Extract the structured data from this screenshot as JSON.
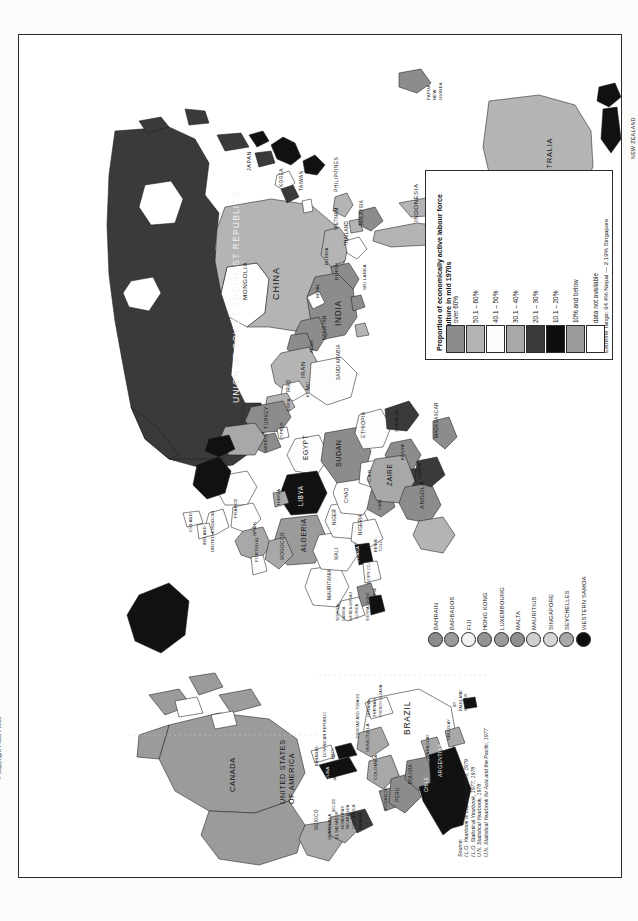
{
  "document": {
    "title": "Workers on the land",
    "copyright": "© Copyright Pluto Press"
  },
  "legend": {
    "title_line1": "Proportion of economically active labour force",
    "title_line2": "in agriculture in mid 1970s",
    "extreme_range": "Extreme range: 94.4% Nepal — 2.19% Singapore",
    "items": [
      {
        "label": "over 60%",
        "color": "#8c8c8c"
      },
      {
        "label": "50.1  –  60%",
        "color": "#b4b4b4"
      },
      {
        "label": "40.1  –  50%",
        "color": "#fbfbfb"
      },
      {
        "label": "30.1  –  40%",
        "color": "#a8a8a8"
      },
      {
        "label": "20.1  –  30%",
        "color": "#3a3a3a"
      },
      {
        "label": "10.1  –  20%",
        "color": "#0d0d0d"
      },
      {
        "label": "10% and below",
        "color": "#9b9b9b"
      },
      {
        "label": "data not available",
        "color": "#ffffff"
      }
    ]
  },
  "micro_states": {
    "items": [
      {
        "label": "BAHRAIN",
        "color": "#8c8c8c"
      },
      {
        "label": "BARBADOS",
        "color": "#9b9b9b"
      },
      {
        "label": "FIJI",
        "color": "#f2f2f2"
      },
      {
        "label": "HONG KONG",
        "color": "#949494"
      },
      {
        "label": "LUXEMBOURG",
        "color": "#9b9b9b"
      },
      {
        "label": "MALTA",
        "color": "#8f8f8f"
      },
      {
        "label": "MAURITIUS",
        "color": "#cfcfcf"
      },
      {
        "label": "SINGAPORE",
        "color": "#d5d5d5"
      },
      {
        "label": "SEYCHELLES",
        "color": "#a8a8a8"
      },
      {
        "label": "WESTERN SAMOA",
        "color": "#0d0d0d"
      }
    ]
  },
  "source": {
    "heading": "Source:",
    "lines": [
      "I.L.O. Yearbook of Labour Statistics, 1979",
      "I.L.O. Statistical Yearbook, 1977, 1978",
      "U.N. Statistical Yearbook, 1978",
      "U.N. Statistical Yearbook for Asia and the Pacific, 1977"
    ]
  },
  "map_labels": [
    {
      "text": "UNION OF SOVIET SOCIALIST REPUBLICS",
      "x": 222,
      "y": 358,
      "size": 8.6,
      "ls": 1.1,
      "color": "#f2f2f2"
    },
    {
      "text": "CHINA",
      "x": 262,
      "y": 255,
      "size": 9.0,
      "ls": 1.0,
      "color": "#141414"
    },
    {
      "text": "MONGOLIA",
      "x": 229,
      "y": 258,
      "size": 6.2,
      "ls": 0.6,
      "color": "#141414"
    },
    {
      "text": "INDIA",
      "x": 324,
      "y": 282,
      "size": 8.2,
      "ls": 0.8,
      "color": "#141414"
    },
    {
      "text": "JAPAN",
      "x": 233,
      "y": 130,
      "size": 5.6,
      "ls": 0.5,
      "color": "#141414"
    },
    {
      "text": "KOREA",
      "x": 265,
      "y": 147,
      "size": 4.8,
      "ls": 0.4,
      "color": "#141414"
    },
    {
      "text": "TAIWAN",
      "x": 285,
      "y": 151,
      "size": 4.8,
      "ls": 0.4,
      "color": "#141414"
    },
    {
      "text": "PHILIPPINES",
      "x": 320,
      "y": 151,
      "size": 5.0,
      "ls": 0.4,
      "color": "#141414"
    },
    {
      "text": "VIETNAM",
      "x": 320,
      "y": 190,
      "size": 4.6,
      "ls": 0.3,
      "color": "#141414"
    },
    {
      "text": "THAILAND",
      "x": 330,
      "y": 206,
      "size": 4.6,
      "ls": 0.3,
      "color": "#141414"
    },
    {
      "text": "MALAYSIA",
      "x": 345,
      "y": 185,
      "size": 4.6,
      "ls": 0.3,
      "color": "#141414"
    },
    {
      "text": "INDONESIA",
      "x": 400,
      "y": 180,
      "size": 6.2,
      "ls": 0.5,
      "color": "#141414"
    },
    {
      "text": "PAPUA",
      "x": 412,
      "y": 60,
      "size": 4.2,
      "ls": 0.3,
      "color": "#141414"
    },
    {
      "text": "NEW",
      "x": 418,
      "y": 60,
      "size": 4.2,
      "ls": 0.3,
      "color": "#141414"
    },
    {
      "text": "GUINEA",
      "x": 424,
      "y": 60,
      "size": 4.2,
      "ls": 0.3,
      "color": "#141414"
    },
    {
      "text": "AUSTRALIA",
      "x": 535,
      "y": 142,
      "size": 7.4,
      "ls": 0.8,
      "color": "#141414"
    },
    {
      "text": "NEW ZEALAND",
      "x": 617,
      "y": 118,
      "size": 5.2,
      "ls": 0.4,
      "color": "#141414"
    },
    {
      "text": "BURMA",
      "x": 310,
      "y": 225,
      "size": 4.4,
      "ls": 0.3,
      "color": "#141414"
    },
    {
      "text": "B'DESH",
      "x": 320,
      "y": 240,
      "size": 4.4,
      "ls": 0.3,
      "color": "#141414"
    },
    {
      "text": "SRI LANKA",
      "x": 348,
      "y": 250,
      "size": 4.4,
      "ls": 0.3,
      "color": "#141414"
    },
    {
      "text": "NEPAL",
      "x": 301,
      "y": 258,
      "size": 4.0,
      "ls": 0.3,
      "color": "#141414"
    },
    {
      "text": "PAKISTAN",
      "x": 308,
      "y": 300,
      "size": 4.6,
      "ls": 0.3,
      "color": "#141414"
    },
    {
      "text": "AFGH",
      "x": 295,
      "y": 313,
      "size": 4.2,
      "ls": 0.3,
      "color": "#141414"
    },
    {
      "text": "IRAN",
      "x": 287,
      "y": 336,
      "size": 6.2,
      "ls": 0.5,
      "color": "#141414"
    },
    {
      "text": "IRAQ",
      "x": 272,
      "y": 352,
      "size": 4.6,
      "ls": 0.3,
      "color": "#141414"
    },
    {
      "text": "SAUDI ARABIA",
      "x": 322,
      "y": 340,
      "size": 4.6,
      "ls": 0.3,
      "color": "#141414"
    },
    {
      "text": "KUWAIT",
      "x": 291,
      "y": 358,
      "size": 3.8,
      "ls": 0.2,
      "color": "#141414"
    },
    {
      "text": "TURKEY",
      "x": 250,
      "y": 388,
      "size": 5.0,
      "ls": 0.4,
      "color": "#141414"
    },
    {
      "text": "SYRIA",
      "x": 272,
      "y": 372,
      "size": 3.8,
      "ls": 0.2,
      "color": "#141414"
    },
    {
      "text": "CYPRUS",
      "x": 265,
      "y": 400,
      "size": 4.0,
      "ls": 0.2,
      "color": "#141414"
    },
    {
      "text": "GREECE",
      "x": 249,
      "y": 412,
      "size": 4.2,
      "ls": 0.3,
      "color": "#141414"
    },
    {
      "text": "EGYPT",
      "x": 290,
      "y": 418,
      "size": 6.6,
      "ls": 0.6,
      "color": "#141414"
    },
    {
      "text": "SUDAN",
      "x": 323,
      "y": 425,
      "size": 7.0,
      "ls": 0.6,
      "color": "#141414"
    },
    {
      "text": "ETHIOPIA",
      "x": 347,
      "y": 397,
      "size": 5.0,
      "ls": 0.4,
      "color": "#141414"
    },
    {
      "text": "SOMALIA",
      "x": 380,
      "y": 392,
      "size": 4.4,
      "ls": 0.3,
      "color": "#141414"
    },
    {
      "text": "KENYA",
      "x": 386,
      "y": 420,
      "size": 4.4,
      "ls": 0.3,
      "color": "#141414"
    },
    {
      "text": "ZAIRE",
      "x": 374,
      "y": 444,
      "size": 6.6,
      "ls": 0.6,
      "color": "#141414"
    },
    {
      "text": "C.A.R.",
      "x": 353,
      "y": 442,
      "size": 4.2,
      "ls": 0.3,
      "color": "#141414"
    },
    {
      "text": "CHAD",
      "x": 330,
      "y": 462,
      "size": 5.0,
      "ls": 0.4,
      "color": "#141414"
    },
    {
      "text": "LIBYA",
      "x": 285,
      "y": 464,
      "size": 6.4,
      "ls": 0.6,
      "color": "#f2f2f2"
    },
    {
      "text": "NIGER",
      "x": 318,
      "y": 485,
      "size": 4.6,
      "ls": 0.3,
      "color": "#141414"
    },
    {
      "text": "NIGERIA",
      "x": 344,
      "y": 495,
      "size": 4.6,
      "ls": 0.3,
      "color": "#141414"
    },
    {
      "text": "CAM.",
      "x": 363,
      "y": 470,
      "size": 4.2,
      "ls": 0.3,
      "color": "#141414"
    },
    {
      "text": "ALGERIA",
      "x": 288,
      "y": 510,
      "size": 6.8,
      "ls": 0.6,
      "color": "#141414"
    },
    {
      "text": "MALI",
      "x": 320,
      "y": 520,
      "size": 4.8,
      "ls": 0.3,
      "color": "#141414"
    },
    {
      "text": "MAURITANIA",
      "x": 313,
      "y": 560,
      "size": 4.6,
      "ls": 0.3,
      "color": "#141414"
    },
    {
      "text": "MOROCCO",
      "x": 266,
      "y": 520,
      "size": 4.8,
      "ls": 0.3,
      "color": "#141414"
    },
    {
      "text": "TUNISIA",
      "x": 262,
      "y": 466,
      "size": 4.0,
      "ls": 0.2,
      "color": "#141414"
    },
    {
      "text": "PORTUGAL",
      "x": 240,
      "y": 522,
      "size": 4.2,
      "ls": 0.3,
      "color": "#141414"
    },
    {
      "text": "SPAIN",
      "x": 238,
      "y": 496,
      "size": 4.4,
      "ls": 0.3,
      "color": "#141414"
    },
    {
      "text": "FRANCE",
      "x": 219,
      "y": 478,
      "size": 4.4,
      "ls": 0.3,
      "color": "#141414"
    },
    {
      "text": "UNITED KINGDOM",
      "x": 196,
      "y": 512,
      "size": 4.2,
      "ls": 0.3,
      "color": "#141414"
    },
    {
      "text": "IRELAND",
      "x": 188,
      "y": 505,
      "size": 4.0,
      "ls": 0.2,
      "color": "#141414"
    },
    {
      "text": "ICELAND",
      "x": 174,
      "y": 492,
      "size": 4.0,
      "ls": 0.2,
      "color": "#141414"
    },
    {
      "text": "GHANA",
      "x": 341,
      "y": 523,
      "size": 4.4,
      "ls": 0.3,
      "color": "#f2f2f2"
    },
    {
      "text": "BENIN",
      "x": 359,
      "y": 513,
      "size": 3.8,
      "ls": 0.2,
      "color": "#141414"
    },
    {
      "text": "TOGO",
      "x": 364,
      "y": 513,
      "size": 3.8,
      "ls": 0.2,
      "color": "#141414"
    },
    {
      "text": "IVORY CO.",
      "x": 352,
      "y": 545,
      "size": 3.8,
      "ls": 0.2,
      "color": "#141414"
    },
    {
      "text": "LIBERIA",
      "x": 358,
      "y": 565,
      "size": 3.8,
      "ls": 0.2,
      "color": "#141414"
    },
    {
      "text": "SIERRA LEONE",
      "x": 351,
      "y": 582,
      "size": 3.6,
      "ls": 0.2,
      "color": "#141414"
    },
    {
      "text": "GUINEA",
      "x": 340,
      "y": 580,
      "size": 3.6,
      "ls": 0.2,
      "color": "#141414"
    },
    {
      "text": "GUINEA-BISSAU",
      "x": 334,
      "y": 582,
      "size": 3.4,
      "ls": 0.2,
      "color": "#141414"
    },
    {
      "text": "GAMBIA",
      "x": 327,
      "y": 582,
      "size": 3.4,
      "ls": 0.2,
      "color": "#141414"
    },
    {
      "text": "SENEGAL",
      "x": 321,
      "y": 582,
      "size": 3.6,
      "ls": 0.2,
      "color": "#141414"
    },
    {
      "text": "ANGOLA",
      "x": 406,
      "y": 468,
      "size": 6.0,
      "ls": 0.5,
      "color": "#141414"
    },
    {
      "text": "ZAMBIA",
      "x": 403,
      "y": 440,
      "size": 4.2,
      "ls": 0.3,
      "color": "#141414"
    },
    {
      "text": "MADAGASCAR",
      "x": 420,
      "y": 398,
      "size": 4.6,
      "ls": 0.3,
      "color": "#141414"
    },
    {
      "text": "CANADA",
      "x": 218,
      "y": 748,
      "size": 7.4,
      "ls": 0.7,
      "color": "#141414"
    },
    {
      "text": "UNITED STATES",
      "x": 268,
      "y": 760,
      "size": 7.2,
      "ls": 0.7,
      "color": "#141414"
    },
    {
      "text": "OF AMERICA",
      "x": 277,
      "y": 760,
      "size": 7.2,
      "ls": 0.7,
      "color": "#141414"
    },
    {
      "text": "MEXICO",
      "x": 300,
      "y": 790,
      "size": 4.8,
      "ls": 0.3,
      "color": "#141414"
    },
    {
      "text": "GUATEMALA",
      "x": 313,
      "y": 800,
      "size": 4.0,
      "ls": 0.2,
      "color": "#141414"
    },
    {
      "text": "EL SALVADOR",
      "x": 320,
      "y": 800,
      "size": 3.8,
      "ls": 0.2,
      "color": "#141414"
    },
    {
      "text": "HONDURAS",
      "x": 326,
      "y": 790,
      "size": 3.8,
      "ls": 0.2,
      "color": "#141414"
    },
    {
      "text": "NICARAGUA",
      "x": 331,
      "y": 790,
      "size": 3.8,
      "ls": 0.2,
      "color": "#141414"
    },
    {
      "text": "COSTA RICA",
      "x": 337,
      "y": 790,
      "size": 3.8,
      "ls": 0.2,
      "color": "#141414"
    },
    {
      "text": "PANAMA",
      "x": 344,
      "y": 790,
      "size": 3.8,
      "ls": 0.2,
      "color": "#141414"
    },
    {
      "text": "BELIZE",
      "x": 317,
      "y": 773,
      "size": 3.6,
      "ls": 0.2,
      "color": "#141414"
    },
    {
      "text": "CUBA",
      "x": 311,
      "y": 740,
      "size": 4.4,
      "ls": 0.3,
      "color": "#f2f2f2"
    },
    {
      "text": "JAMAICA",
      "x": 318,
      "y": 742,
      "size": 3.8,
      "ls": 0.2,
      "color": "#141414"
    },
    {
      "text": "HAITI",
      "x": 316,
      "y": 720,
      "size": 3.8,
      "ls": 0.2,
      "color": "#141414"
    },
    {
      "text": "DOMINICAN REPUBLIC",
      "x": 308,
      "y": 718,
      "size": 3.8,
      "ls": 0.2,
      "color": "#141414"
    },
    {
      "text": "BAHAMAS",
      "x": 300,
      "y": 727,
      "size": 3.8,
      "ls": 0.2,
      "color": "#141414"
    },
    {
      "text": "TRINIDAD AND TOBAGO",
      "x": 341,
      "y": 700,
      "size": 3.6,
      "ls": 0.2,
      "color": "#141414"
    },
    {
      "text": "VENEZUELA",
      "x": 351,
      "y": 712,
      "size": 4.4,
      "ls": 0.3,
      "color": "#141414"
    },
    {
      "text": "COLOMBIA",
      "x": 359,
      "y": 740,
      "size": 4.4,
      "ls": 0.3,
      "color": "#141414"
    },
    {
      "text": "ECUADOR",
      "x": 369,
      "y": 770,
      "size": 4.2,
      "ls": 0.3,
      "color": "#141414"
    },
    {
      "text": "PERU",
      "x": 381,
      "y": 762,
      "size": 4.8,
      "ls": 0.3,
      "color": "#141414"
    },
    {
      "text": "BOLIVIA",
      "x": 394,
      "y": 744,
      "size": 4.6,
      "ls": 0.3,
      "color": "#141414"
    },
    {
      "text": "BRAZIL",
      "x": 393,
      "y": 690,
      "size": 8.4,
      "ls": 0.8,
      "color": "#141414"
    },
    {
      "text": "GUYANA",
      "x": 352,
      "y": 678,
      "size": 3.8,
      "ls": 0.2,
      "color": "#141414"
    },
    {
      "text": "SURINAM",
      "x": 358,
      "y": 678,
      "size": 3.8,
      "ls": 0.2,
      "color": "#141414"
    },
    {
      "text": "FRENCH GUIANA",
      "x": 364,
      "y": 678,
      "size": 3.6,
      "ls": 0.2,
      "color": "#141414"
    },
    {
      "text": "PARAGUAY",
      "x": 411,
      "y": 717,
      "size": 4.0,
      "ls": 0.2,
      "color": "#141414"
    },
    {
      "text": "CHILE",
      "x": 410,
      "y": 752,
      "size": 4.6,
      "ls": 0.3,
      "color": "#f2f2f2"
    },
    {
      "text": "ARGENTINA",
      "x": 424,
      "y": 736,
      "size": 5.2,
      "ls": 0.4,
      "color": "#f2f2f2"
    },
    {
      "text": "URUGUAY",
      "x": 432,
      "y": 700,
      "size": 4.0,
      "ls": 0.2,
      "color": "#141414"
    },
    {
      "text": "FALKLAND",
      "x": 444,
      "y": 672,
      "size": 3.8,
      "ls": 0.2,
      "color": "#141414"
    },
    {
      "text": "ISLANDS",
      "x": 449,
      "y": 672,
      "size": 3.8,
      "ls": 0.2,
      "color": "#141414"
    },
    {
      "text": "BR",
      "x": 438,
      "y": 668,
      "size": 3.4,
      "ls": 0.2,
      "color": "#141414"
    }
  ]
}
